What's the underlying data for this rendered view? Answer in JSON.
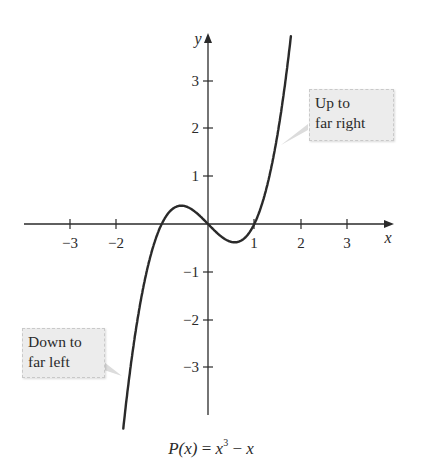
{
  "chart_data": {
    "type": "line",
    "title": "",
    "function": "P(x) = x^3 - x",
    "caption": "P(x) = x³ − x",
    "xlabel": "x",
    "ylabel": "y",
    "xlim": [
      -3.7,
      3.7
    ],
    "ylim": [
      -4,
      3.8
    ],
    "xticks": [
      -3,
      -2,
      1,
      2,
      3
    ],
    "xtick_labels": [
      "−3",
      "−2",
      "1",
      "2",
      "3"
    ],
    "yticks": [
      3,
      2,
      1,
      -1,
      -2,
      -3
    ],
    "ytick_labels": [
      "3",
      "2",
      "1",
      "−1",
      "−2",
      "−3"
    ],
    "grid": false,
    "series": [
      {
        "name": "P(x) = x^3 - x",
        "x": [
          -1.8,
          -1.5,
          -1.0,
          -0.577,
          0,
          0.577,
          1.0,
          1.5,
          1.8
        ],
        "y": [
          -4.03,
          -1.875,
          0,
          0.385,
          0,
          -0.385,
          0,
          1.875,
          4.03
        ]
      }
    ],
    "annotations": [
      {
        "text": "Up to far right",
        "lines": [
          "Up to",
          "far right"
        ],
        "points_to": [
          1.5,
          1.6
        ]
      },
      {
        "text": "Down to far left",
        "lines": [
          "Down to",
          "far left"
        ],
        "points_to": [
          -1.8,
          -3.2
        ]
      }
    ]
  },
  "axes": {
    "x_label": "x",
    "y_label": "y",
    "x_tick_labels": [
      "−3",
      "−2",
      "1",
      "2",
      "3"
    ],
    "y_tick_labels": [
      "3",
      "2",
      "1",
      "−1",
      "−2",
      "−3"
    ]
  },
  "callouts": {
    "right": {
      "line1": "Up to",
      "line2": "far right"
    },
    "left": {
      "line1": "Down to",
      "line2": "far left"
    }
  },
  "caption": {
    "lhs": "P(x)",
    "eq": " = ",
    "base": "x",
    "exp": "3",
    "minus": " − ",
    "tail": "x"
  }
}
